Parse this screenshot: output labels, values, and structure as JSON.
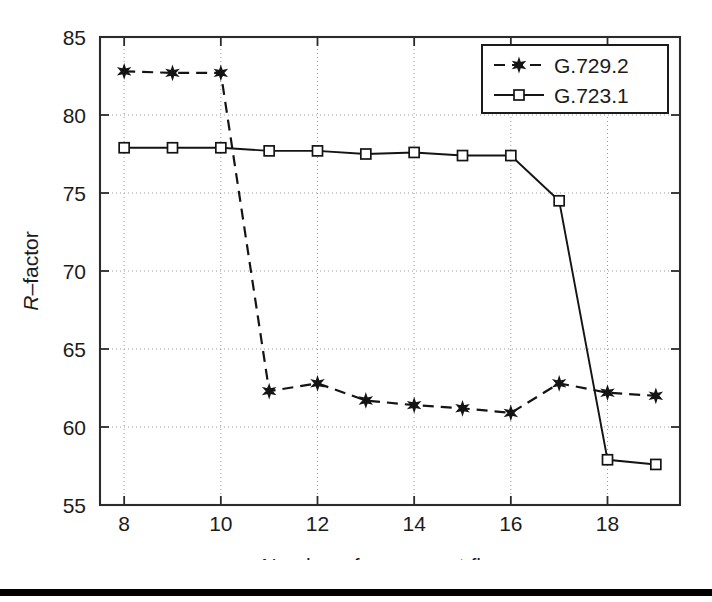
{
  "chart_data": {
    "type": "line",
    "title": "",
    "xlabel": "Number of concurrent flows",
    "ylabel": "R-factor",
    "ylabel_italic_prefix": "R",
    "ylabel_rest": "–factor",
    "xlim": [
      7.5,
      19.5
    ],
    "ylim": [
      55,
      85
    ],
    "xticks": [
      8,
      10,
      12,
      14,
      16,
      18
    ],
    "xtick_labels": [
      "8",
      "10",
      "12",
      "14",
      "16",
      "18"
    ],
    "yticks": [
      55,
      60,
      65,
      70,
      75,
      80,
      85
    ],
    "ytick_labels": [
      "55",
      "60",
      "65",
      "70",
      "75",
      "80",
      "85"
    ],
    "grid": true,
    "grid_style": "dotted",
    "x": [
      8,
      9,
      10,
      11,
      12,
      13,
      14,
      15,
      16,
      17,
      18,
      19
    ],
    "legend_position": "top-right",
    "series": [
      {
        "name": "G.729.2",
        "marker": "star",
        "linestyle": "dashed",
        "color": "#141414",
        "values": [
          82.8,
          82.7,
          82.7,
          62.3,
          62.8,
          61.7,
          61.4,
          61.2,
          60.9,
          62.8,
          62.2,
          62.0
        ]
      },
      {
        "name": "G.723.1",
        "marker": "square",
        "linestyle": "solid",
        "color": "#141414",
        "values": [
          77.9,
          77.9,
          77.9,
          77.7,
          77.7,
          77.5,
          77.6,
          77.4,
          77.4,
          74.5,
          57.9,
          57.6
        ]
      }
    ]
  },
  "legend": {
    "entries": [
      {
        "label": "G.729.2"
      },
      {
        "label": "G.723.1"
      }
    ]
  },
  "footer": {
    "rule": ""
  }
}
